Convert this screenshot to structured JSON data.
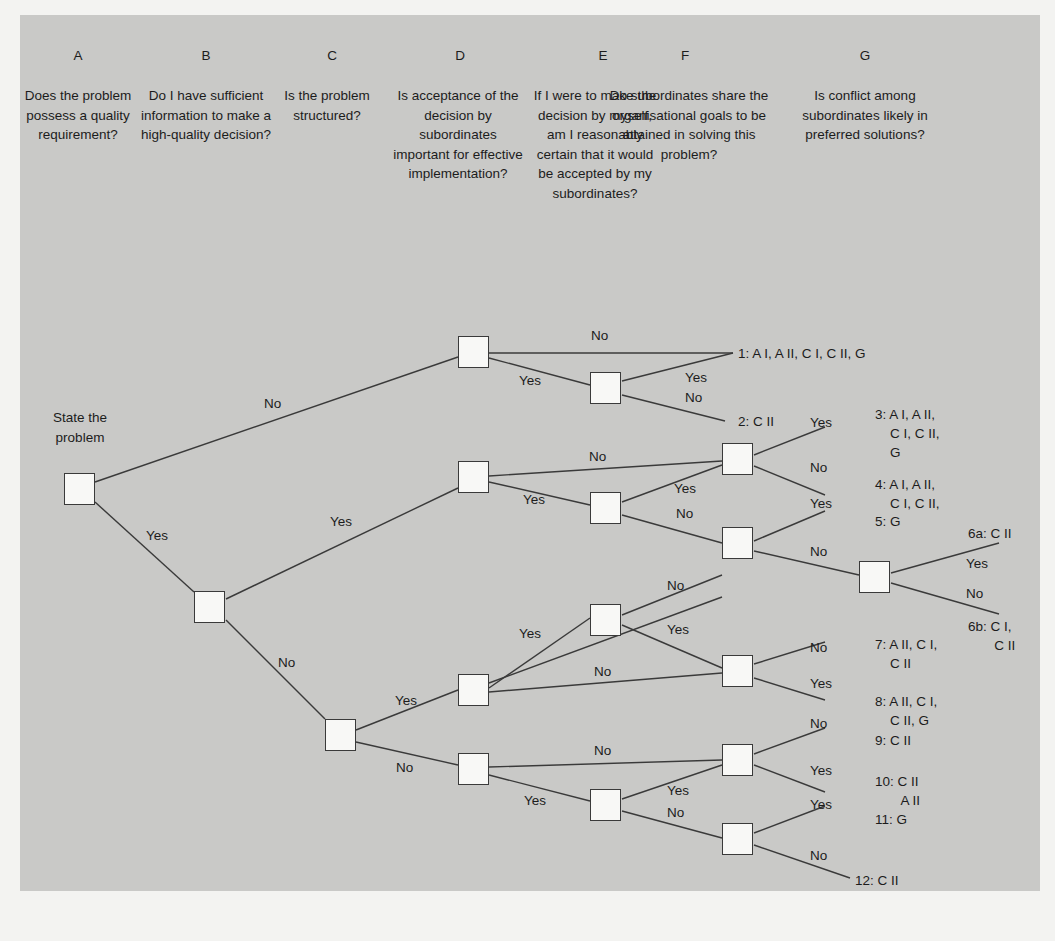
{
  "diagram": {
    "start_label": "State the problem",
    "columns": [
      {
        "letter": "A",
        "question": "Does the problem possess a quality requirement?"
      },
      {
        "letter": "B",
        "question": "Do I have sufficient information to make a high-quality decision?"
      },
      {
        "letter": "C",
        "question": "Is the problem structured?"
      },
      {
        "letter": "D",
        "question": "Is acceptance of the decision by subordinates important for effective implementation?"
      },
      {
        "letter": "E",
        "question": "If I were to make the decision by myself, am I reasonably certain that it would be accepted by my subordinates?"
      },
      {
        "letter": "F",
        "question": "Do subordinates share the organisational goals to be attained in solving this problem?"
      },
      {
        "letter": "G",
        "question": "Is conflict among subordinates likely in preferred solutions?"
      }
    ],
    "edge_labels": {
      "start_no": "No",
      "start_yes": "Yes",
      "b_yes": "Yes",
      "b_no": "No",
      "dtop_no": "No",
      "dtop_yes": "Yes",
      "etop_yes": "Yes",
      "etop_no": "No",
      "dmid_no": "No",
      "dmid_yes": "Yes",
      "emid_yes": "Yes",
      "emid_no": "No",
      "f1_yes": "Yes",
      "f1_no": "No",
      "f2_yes": "Yes",
      "f2_no": "No",
      "g_yes": "Yes",
      "g_no": "No",
      "c_yes": "Yes",
      "c_no": "No",
      "dlow_yes": "Yes",
      "dlow_no": "No",
      "elow_no": "No",
      "elow_yes": "Yes",
      "f3_no": "No",
      "f3_yes": "Yes",
      "dbot_no": "No",
      "dbot_yes": "Yes",
      "ebot_yes": "Yes",
      "ebot_no": "No",
      "f4_no": "No",
      "f4_yes": "Yes",
      "f5_yes": "Yes",
      "f5_no": "No"
    },
    "outcomes": [
      {
        "id": "1",
        "text": "1: A I, A II, C I, C II, G"
      },
      {
        "id": "2",
        "text": "2: C II"
      },
      {
        "id": "3",
        "text": "3: A I, A II,\n    C I, C II,\n    G"
      },
      {
        "id": "4",
        "text": "4: A I, A II,\n    C I, C II,"
      },
      {
        "id": "5",
        "text": "5: G"
      },
      {
        "id": "6a",
        "text": "6a: C II"
      },
      {
        "id": "6b",
        "text": "6b: C I,\n       C II"
      },
      {
        "id": "7",
        "text": "7: A II, C I,\n    C II"
      },
      {
        "id": "8",
        "text": "8: A II, C I,\n    C II, G"
      },
      {
        "id": "9",
        "text": "9: C II"
      },
      {
        "id": "10",
        "text": "10: C II\n       A II"
      },
      {
        "id": "11",
        "text": "11: G"
      },
      {
        "id": "12",
        "text": "12: C II"
      }
    ],
    "colors": {
      "page_background": "#f3f3f1",
      "panel_background": "#c9c9c7",
      "node_fill": "#f8f8f6",
      "line": "#3a3a3a",
      "text": "#1c1c1c"
    }
  }
}
